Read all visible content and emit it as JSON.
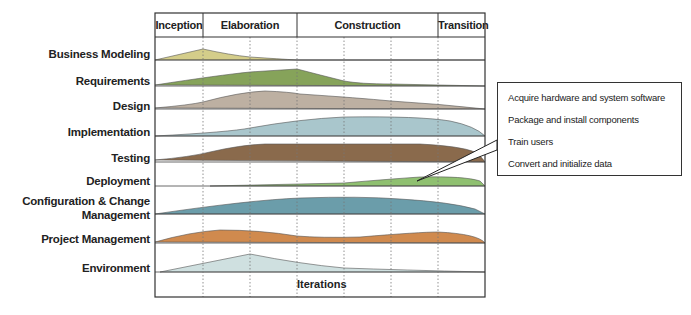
{
  "phases": [
    {
      "label": "Inception"
    },
    {
      "label": "Elaboration"
    },
    {
      "label": "Construction"
    },
    {
      "label": "Transition"
    }
  ],
  "disciplines": [
    {
      "label": "Business Modeling",
      "color": "#d4cd8a"
    },
    {
      "label": "Requirements",
      "color": "#86a35a"
    },
    {
      "label": "Design",
      "color": "#bdb0a2"
    },
    {
      "label": "Implementation",
      "color": "#a9c6cc"
    },
    {
      "label": "Testing",
      "color": "#8a6a4c"
    },
    {
      "label": "Deployment",
      "color": "#8fc070"
    },
    {
      "label": "Configuration & Change",
      "label2": "Management",
      "color": "#6b9daa"
    },
    {
      "label": "Project Management",
      "color": "#d08a4e"
    },
    {
      "label": "Environment",
      "color": "#cfe0e0"
    }
  ],
  "xaxis_label": "Iterations",
  "callout": {
    "items": [
      "Acquire hardware and system software",
      "Package and install components",
      "Train users",
      "Convert and initialize data"
    ]
  }
}
